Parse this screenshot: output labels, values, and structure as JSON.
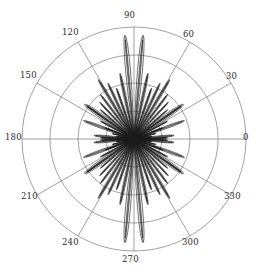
{
  "figure": {
    "name": "polar-radiation-pattern",
    "background_color": "#ffffff",
    "grid_color": "#7a7a7a",
    "curve_color": "#1a1a1a"
  },
  "chart_data": {
    "type": "line",
    "subtype": "polar",
    "title": "",
    "xlabel": "",
    "ylabel": "",
    "grid": true,
    "legend": null,
    "angular_unit": "degrees",
    "angular_tick_labels": [
      "0",
      "30",
      "60",
      "90",
      "120",
      "150",
      "180",
      "210",
      "240",
      "270",
      "300",
      "330"
    ],
    "angular_ticks": [
      0,
      30,
      60,
      90,
      120,
      150,
      180,
      210,
      240,
      270,
      300,
      330
    ],
    "angular_direction": "counterclockwise",
    "angular_zero_location": "E",
    "radial_rings": 4,
    "radial_ring_fractions": [
      0.25,
      0.5,
      0.75,
      1.0
    ],
    "radial_tick_labels": [],
    "rlim": [
      0,
      1
    ],
    "center_px": [
      134,
      139
    ],
    "outer_radius_px": 112,
    "lobes": [
      {
        "angle": 2,
        "radius": 0.3,
        "halfwidth": 1.6
      },
      {
        "angle": 8,
        "radius": 0.16,
        "halfwidth": 1.5
      },
      {
        "angle": 14,
        "radius": 0.2,
        "halfwidth": 1.6
      },
      {
        "angle": 21,
        "radius": 0.28,
        "halfwidth": 1.8
      },
      {
        "angle": 28,
        "radius": 0.34,
        "halfwidth": 1.8
      },
      {
        "angle": 35,
        "radius": 0.52,
        "halfwidth": 2.0
      },
      {
        "angle": 41,
        "radius": 0.4,
        "halfwidth": 1.9
      },
      {
        "angle": 47,
        "radius": 0.45,
        "halfwidth": 2.0
      },
      {
        "angle": 53,
        "radius": 0.5,
        "halfwidth": 2.1
      },
      {
        "angle": 59,
        "radius": 0.62,
        "halfwidth": 2.2
      },
      {
        "angle": 65,
        "radius": 0.55,
        "halfwidth": 2.2
      },
      {
        "angle": 71,
        "radius": 0.48,
        "halfwidth": 2.1
      },
      {
        "angle": 78,
        "radius": 0.6,
        "halfwidth": 2.3
      },
      {
        "angle": 85,
        "radius": 0.93,
        "halfwidth": 3.0
      },
      {
        "angle": 95,
        "radius": 0.93,
        "halfwidth": 3.0
      },
      {
        "angle": 102,
        "radius": 0.6,
        "halfwidth": 2.3
      },
      {
        "angle": 109,
        "radius": 0.48,
        "halfwidth": 2.1
      },
      {
        "angle": 115,
        "radius": 0.55,
        "halfwidth": 2.2
      },
      {
        "angle": 121,
        "radius": 0.62,
        "halfwidth": 2.2
      },
      {
        "angle": 127,
        "radius": 0.5,
        "halfwidth": 2.1
      },
      {
        "angle": 133,
        "radius": 0.45,
        "halfwidth": 2.0
      },
      {
        "angle": 139,
        "radius": 0.4,
        "halfwidth": 1.9
      },
      {
        "angle": 145,
        "radius": 0.52,
        "halfwidth": 2.0
      },
      {
        "angle": 152,
        "radius": 0.34,
        "halfwidth": 1.8
      },
      {
        "angle": 159,
        "radius": 0.28,
        "halfwidth": 1.8
      },
      {
        "angle": 166,
        "radius": 0.2,
        "halfwidth": 1.6
      },
      {
        "angle": 172,
        "radius": 0.16,
        "halfwidth": 1.5
      },
      {
        "angle": 178,
        "radius": 0.3,
        "halfwidth": 1.6
      },
      {
        "angle": 182,
        "radius": 0.3,
        "halfwidth": 1.6
      },
      {
        "angle": 188,
        "radius": 0.16,
        "halfwidth": 1.5
      },
      {
        "angle": 194,
        "radius": 0.2,
        "halfwidth": 1.6
      },
      {
        "angle": 201,
        "radius": 0.28,
        "halfwidth": 1.8
      },
      {
        "angle": 208,
        "radius": 0.34,
        "halfwidth": 1.8
      },
      {
        "angle": 215,
        "radius": 0.52,
        "halfwidth": 2.0
      },
      {
        "angle": 221,
        "radius": 0.4,
        "halfwidth": 1.9
      },
      {
        "angle": 227,
        "radius": 0.45,
        "halfwidth": 2.0
      },
      {
        "angle": 233,
        "radius": 0.5,
        "halfwidth": 2.1
      },
      {
        "angle": 239,
        "radius": 0.62,
        "halfwidth": 2.2
      },
      {
        "angle": 245,
        "radius": 0.55,
        "halfwidth": 2.2
      },
      {
        "angle": 251,
        "radius": 0.48,
        "halfwidth": 2.1
      },
      {
        "angle": 258,
        "radius": 0.6,
        "halfwidth": 2.3
      },
      {
        "angle": 265,
        "radius": 0.93,
        "halfwidth": 3.0
      },
      {
        "angle": 275,
        "radius": 0.93,
        "halfwidth": 3.0
      },
      {
        "angle": 282,
        "radius": 0.6,
        "halfwidth": 2.3
      },
      {
        "angle": 289,
        "radius": 0.48,
        "halfwidth": 2.1
      },
      {
        "angle": 295,
        "radius": 0.55,
        "halfwidth": 2.2
      },
      {
        "angle": 301,
        "radius": 0.62,
        "halfwidth": 2.2
      },
      {
        "angle": 307,
        "radius": 0.5,
        "halfwidth": 2.1
      },
      {
        "angle": 313,
        "radius": 0.45,
        "halfwidth": 2.0
      },
      {
        "angle": 319,
        "radius": 0.4,
        "halfwidth": 1.9
      },
      {
        "angle": 325,
        "radius": 0.52,
        "halfwidth": 2.0
      },
      {
        "angle": 332,
        "radius": 0.34,
        "halfwidth": 1.8
      },
      {
        "angle": 339,
        "radius": 0.28,
        "halfwidth": 1.8
      },
      {
        "angle": 346,
        "radius": 0.2,
        "halfwidth": 1.6
      },
      {
        "angle": 352,
        "radius": 0.16,
        "halfwidth": 1.5
      },
      {
        "angle": 358,
        "radius": 0.3,
        "halfwidth": 1.6
      }
    ],
    "broad_lobes": [
      {
        "angle": 35,
        "radius": 0.54,
        "halfwidth": 4.5
      },
      {
        "angle": 145,
        "radius": 0.54,
        "halfwidth": 4.5
      },
      {
        "angle": 215,
        "radius": 0.54,
        "halfwidth": 4.5
      },
      {
        "angle": 325,
        "radius": 0.54,
        "halfwidth": 4.5
      },
      {
        "angle": 5,
        "radius": 0.36,
        "halfwidth": 3.2
      },
      {
        "angle": 175,
        "radius": 0.36,
        "halfwidth": 3.2
      },
      {
        "angle": 185,
        "radius": 0.36,
        "halfwidth": 3.2
      },
      {
        "angle": 355,
        "radius": 0.36,
        "halfwidth": 3.2
      },
      {
        "angle": 20,
        "radius": 0.48,
        "halfwidth": 3.0
      },
      {
        "angle": 160,
        "radius": 0.48,
        "halfwidth": 3.0
      },
      {
        "angle": 200,
        "radius": 0.48,
        "halfwidth": 3.0
      },
      {
        "angle": 340,
        "radius": 0.48,
        "halfwidth": 3.0
      }
    ]
  },
  "labels": {
    "t0": {
      "text": "0",
      "left": 243,
      "top": 133
    },
    "t30": {
      "text": "30",
      "left": 226,
      "top": 72
    },
    "t60": {
      "text": "60",
      "left": 183,
      "top": 30
    },
    "t90": {
      "text": "90",
      "left": 124,
      "top": 11
    },
    "t120": {
      "text": "120",
      "left": 62,
      "top": 28
    },
    "t150": {
      "text": "150",
      "left": 20,
      "top": 71
    },
    "t180": {
      "text": "180",
      "left": 5,
      "top": 133
    },
    "t210": {
      "text": "210",
      "left": 21,
      "top": 192
    },
    "t240": {
      "text": "240",
      "left": 62,
      "top": 238
    },
    "t270": {
      "text": "270",
      "left": 122,
      "top": 255
    },
    "t300": {
      "text": "300",
      "left": 182,
      "top": 238
    },
    "t330": {
      "text": "330",
      "left": 224,
      "top": 192
    }
  }
}
